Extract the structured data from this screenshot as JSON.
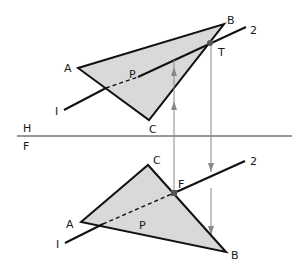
{
  "diagram": {
    "fold_line": {
      "upper_label": "H",
      "lower_label": "F"
    },
    "top_view": {
      "vertices": {
        "A": "A",
        "B": "B",
        "C": "C"
      },
      "line_labels": {
        "start": "I",
        "end": "2"
      },
      "point_P": "P",
      "point_T": "T"
    },
    "front_view": {
      "vertices": {
        "A": "A",
        "B": "B",
        "C": "C"
      },
      "line_labels": {
        "start": "I",
        "end": "2"
      },
      "point_P": "P",
      "point_F": "F"
    },
    "colors": {
      "plane_fill": "#d9d9d9",
      "line": "#111111",
      "projector": "#777777"
    }
  }
}
